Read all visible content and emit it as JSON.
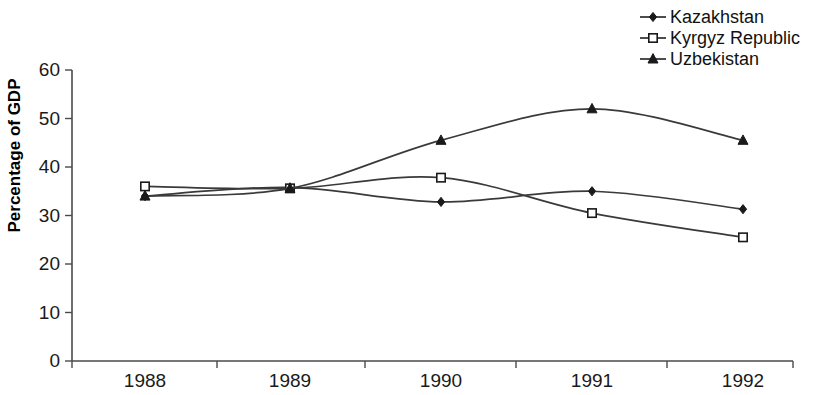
{
  "chart_data": {
    "type": "line",
    "title": "",
    "subtitle": "",
    "xlabel": "",
    "ylabel": "Percentage of GDP",
    "categories": [
      "1988",
      "1989",
      "1990",
      "1991",
      "1992"
    ],
    "x_tick_labels": [
      "1988",
      "1989",
      "1990",
      "1991",
      "1992"
    ],
    "y_tick_labels": [
      "0",
      "10",
      "20",
      "30",
      "40",
      "50",
      "60"
    ],
    "y_ticks": [
      0,
      10,
      20,
      30,
      40,
      50,
      60
    ],
    "ylim": [
      0,
      60
    ],
    "grid": false,
    "legend_position": "top-right",
    "series": [
      {
        "name": "Kazakhstan",
        "marker": "filled-diamond",
        "values": [
          34.0,
          35.8,
          32.8,
          35.0,
          31.3
        ]
      },
      {
        "name": "Kyrgyz Republic",
        "marker": "open-square",
        "values": [
          36.0,
          35.6,
          37.8,
          30.5,
          25.5
        ]
      },
      {
        "name": "Uzbekistan",
        "marker": "filled-triangle",
        "values": [
          34.0,
          35.6,
          45.5,
          52.0,
          45.5
        ]
      }
    ],
    "colors": {
      "line": "#3a3a3a",
      "axis": "#4a4a4a",
      "text": "#1a1a1a",
      "background": "#ffffff"
    }
  },
  "legend": {
    "items": [
      {
        "label": "Kazakhstan",
        "marker": "filled-diamond"
      },
      {
        "label": "Kyrgyz Republic",
        "marker": "open-square"
      },
      {
        "label": "Uzbekistan",
        "marker": "filled-triangle"
      }
    ]
  },
  "axes": {
    "y_title": "Percentage of GDP"
  }
}
